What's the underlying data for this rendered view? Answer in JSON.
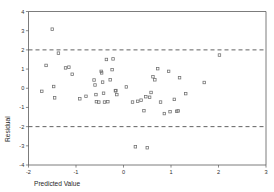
{
  "chart_data": {
    "type": "scatter",
    "title": "",
    "xlabel": "Predicted Value",
    "ylabel": "Residual",
    "xlim": [
      -2,
      3
    ],
    "ylim": [
      -4,
      4
    ],
    "xticks": [
      -2,
      -1,
      0,
      1,
      2,
      3
    ],
    "yticks": [
      -4,
      -3,
      -2,
      -1,
      0,
      1,
      2,
      3,
      4
    ],
    "xtick_labels": [
      "-2",
      "-1",
      "0",
      "1",
      "2",
      "3"
    ],
    "ytick_labels": [
      "-4",
      "-3",
      "-2",
      "-1",
      "0",
      "1",
      "2",
      "3",
      "4"
    ],
    "grid": false,
    "legend": false,
    "marker_style": "open-square",
    "reference_lines": [
      {
        "name": "upper-limit",
        "orientation": "horizontal",
        "y": 2,
        "style": "dashed"
      },
      {
        "name": "lower-limit",
        "orientation": "horizontal",
        "y": -2,
        "style": "dashed"
      }
    ],
    "series": [
      {
        "name": "residuals",
        "points": [
          [
            -1.5,
            3.08
          ],
          [
            -1.37,
            1.83
          ],
          [
            -1.72,
            -0.16
          ],
          [
            -1.63,
            1.19
          ],
          [
            -1.45,
            -0.5
          ],
          [
            -1.47,
            0.09
          ],
          [
            -1.22,
            1.06
          ],
          [
            -1.15,
            1.1
          ],
          [
            -1.08,
            0.73
          ],
          [
            -0.92,
            -0.55
          ],
          [
            -0.79,
            -0.42
          ],
          [
            -0.62,
            0.43
          ],
          [
            -0.6,
            0.17
          ],
          [
            -0.58,
            -0.33
          ],
          [
            -0.57,
            -0.7
          ],
          [
            -0.52,
            -0.72
          ],
          [
            -0.47,
            0.88
          ],
          [
            -0.46,
            0.8
          ],
          [
            -0.44,
            0.32
          ],
          [
            -0.42,
            -0.26
          ],
          [
            -0.4,
            -0.72
          ],
          [
            -0.36,
            1.5
          ],
          [
            -0.33,
            -0.7
          ],
          [
            -0.28,
            0.44
          ],
          [
            -0.24,
            0.97
          ],
          [
            -0.22,
            1.53
          ],
          [
            -0.17,
            -0.13
          ],
          [
            -0.16,
            -0.12
          ],
          [
            -0.14,
            -0.33
          ],
          [
            0.06,
            0.07
          ],
          [
            0.19,
            -0.72
          ],
          [
            0.25,
            -3.05
          ],
          [
            0.3,
            -0.68
          ],
          [
            0.37,
            -0.62
          ],
          [
            0.43,
            -1.17
          ],
          [
            0.47,
            -0.44
          ],
          [
            0.5,
            -3.1
          ],
          [
            0.55,
            -0.47
          ],
          [
            0.58,
            -0.22
          ],
          [
            0.62,
            0.6
          ],
          [
            0.66,
            0.44
          ],
          [
            0.72,
            1.02
          ],
          [
            0.78,
            -0.72
          ],
          [
            0.86,
            -1.32
          ],
          [
            0.95,
            0.88
          ],
          [
            0.98,
            -1.22
          ],
          [
            1.07,
            -0.58
          ],
          [
            1.12,
            -1.2
          ],
          [
            1.15,
            -1.18
          ],
          [
            1.18,
            0.55
          ],
          [
            1.31,
            -0.28
          ],
          [
            1.7,
            0.3
          ],
          [
            2.02,
            1.73
          ]
        ]
      }
    ]
  },
  "axes": {
    "x_title": "Predicted Value",
    "y_title": "Residual"
  }
}
